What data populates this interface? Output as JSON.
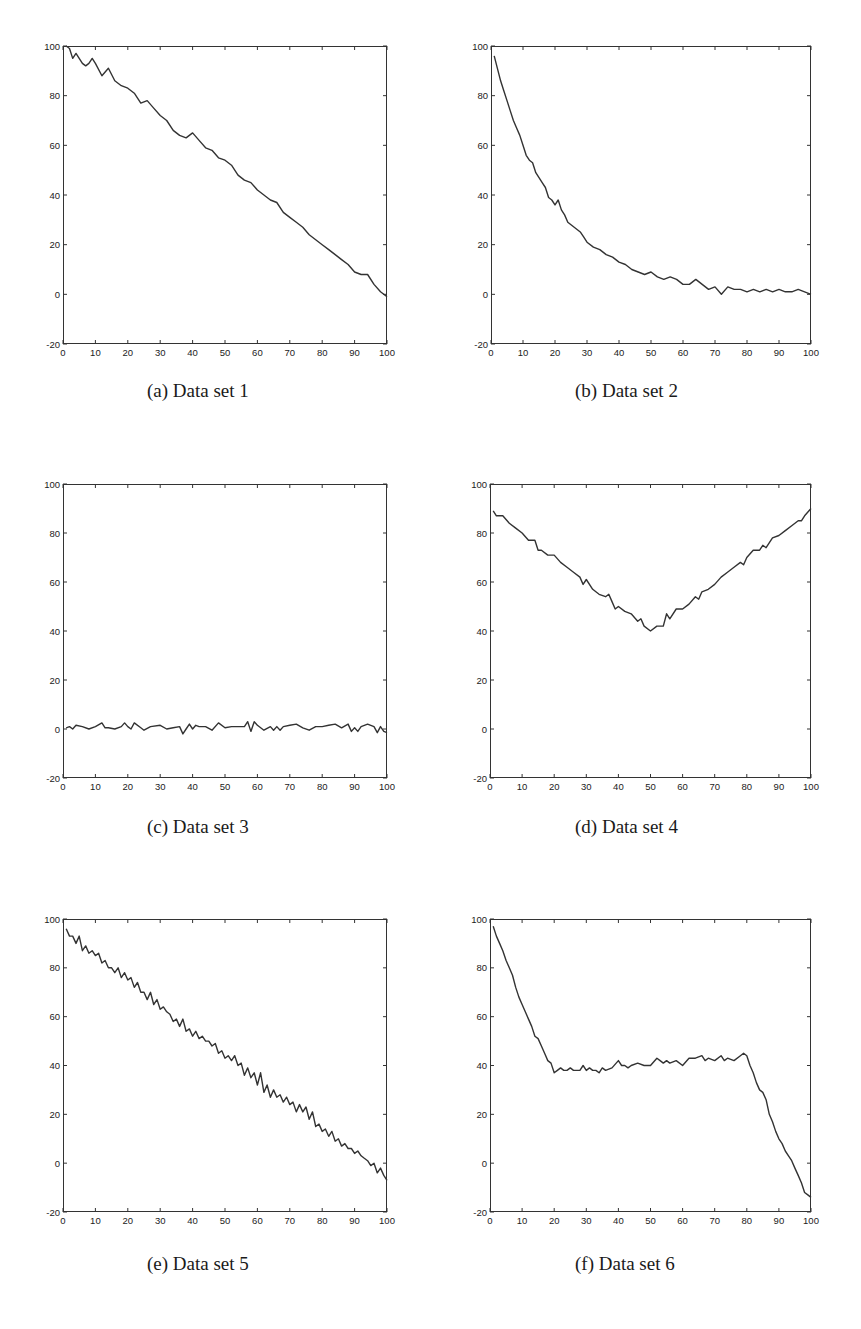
{
  "figure": {
    "panels": [
      {
        "id": "a",
        "caption": "(a) Data set 1"
      },
      {
        "id": "b",
        "caption": "(b) Data set 2"
      },
      {
        "id": "c",
        "caption": "(c) Data set 3"
      },
      {
        "id": "d",
        "caption": "(d) Data set 4"
      },
      {
        "id": "e",
        "caption": "(e) Data set 5"
      },
      {
        "id": "f",
        "caption": "(f) Data set 6"
      }
    ],
    "line_color": "#333333",
    "axis_color": "#333333"
  },
  "chart_data": [
    {
      "type": "line",
      "title": "(a) Data set 1",
      "xlabel": "",
      "ylabel": "",
      "xlim": [
        0,
        100
      ],
      "ylim": [
        -20,
        100
      ],
      "xticks": [
        0,
        10,
        20,
        30,
        40,
        50,
        60,
        70,
        80,
        90,
        100
      ],
      "yticks": [
        -20,
        0,
        20,
        40,
        60,
        80,
        100
      ],
      "grid": false,
      "x": [
        1,
        2,
        3,
        4,
        5,
        6,
        7,
        8,
        9,
        10,
        12,
        14,
        16,
        18,
        20,
        22,
        24,
        26,
        28,
        30,
        32,
        34,
        36,
        38,
        40,
        42,
        44,
        46,
        48,
        50,
        52,
        54,
        56,
        58,
        60,
        62,
        64,
        66,
        68,
        70,
        72,
        74,
        76,
        78,
        80,
        82,
        84,
        86,
        88,
        90,
        92,
        94,
        96,
        98,
        100
      ],
      "values": [
        100,
        99,
        95,
        97,
        95,
        93,
        92,
        93,
        95,
        93,
        88,
        91,
        86,
        84,
        83,
        81,
        77,
        78,
        75,
        72,
        70,
        66,
        64,
        63,
        65,
        62,
        59,
        58,
        55,
        54,
        52,
        48,
        46,
        45,
        42,
        40,
        38,
        37,
        33,
        31,
        29,
        27,
        24,
        22,
        20,
        18,
        16,
        14,
        12,
        9,
        8,
        8,
        4,
        1,
        -1
      ]
    },
    {
      "type": "line",
      "title": "(b) Data set 2",
      "xlabel": "",
      "ylabel": "",
      "xlim": [
        0,
        100
      ],
      "ylim": [
        -20,
        100
      ],
      "xticks": [
        0,
        10,
        20,
        30,
        40,
        50,
        60,
        70,
        80,
        90,
        100
      ],
      "yticks": [
        -20,
        0,
        20,
        40,
        60,
        80,
        100
      ],
      "grid": false,
      "x": [
        1,
        2,
        3,
        4,
        5,
        6,
        7,
        8,
        9,
        10,
        11,
        12,
        13,
        14,
        15,
        16,
        17,
        18,
        19,
        20,
        21,
        22,
        23,
        24,
        25,
        26,
        27,
        28,
        29,
        30,
        32,
        34,
        36,
        38,
        40,
        42,
        44,
        46,
        48,
        50,
        52,
        54,
        56,
        58,
        60,
        62,
        64,
        66,
        68,
        70,
        72,
        74,
        76,
        78,
        80,
        82,
        84,
        86,
        88,
        90,
        92,
        94,
        96,
        98,
        100
      ],
      "values": [
        96,
        91,
        86,
        82,
        78,
        74,
        70,
        67,
        64,
        60,
        56,
        54,
        53,
        49,
        47,
        45,
        43,
        39,
        38,
        36,
        38,
        34,
        32,
        29,
        28,
        27,
        26,
        25,
        23,
        21,
        19,
        18,
        16,
        15,
        13,
        12,
        10,
        9,
        8,
        9,
        7,
        6,
        7,
        6,
        4,
        4,
        6,
        4,
        2,
        3,
        0,
        3,
        2,
        2,
        1,
        2,
        1,
        2,
        1,
        2,
        1,
        1,
        2,
        1,
        0
      ]
    },
    {
      "type": "line",
      "title": "(c) Data set 3",
      "xlabel": "",
      "ylabel": "",
      "xlim": [
        0,
        100
      ],
      "ylim": [
        -20,
        100
      ],
      "xticks": [
        0,
        10,
        20,
        30,
        40,
        50,
        60,
        70,
        80,
        90,
        100
      ],
      "yticks": [
        -20,
        0,
        20,
        40,
        60,
        80,
        100
      ],
      "grid": false,
      "x": [
        1,
        2,
        3,
        4,
        6,
        8,
        10,
        12,
        13,
        14,
        16,
        18,
        19,
        20,
        21,
        22,
        24,
        25,
        27,
        30,
        32,
        34,
        36,
        37,
        38,
        39,
        40,
        41,
        42,
        44,
        46,
        48,
        50,
        52,
        54,
        56,
        57,
        58,
        59,
        60,
        62,
        64,
        65,
        66,
        67,
        68,
        70,
        72,
        74,
        76,
        78,
        80,
        82,
        84,
        86,
        88,
        89,
        90,
        91,
        92,
        94,
        96,
        97,
        98,
        99,
        100
      ],
      "values": [
        0.5,
        1,
        0,
        1.5,
        1,
        0,
        1,
        2.5,
        0.5,
        0.5,
        0,
        1,
        2.5,
        1,
        0,
        2.5,
        0.5,
        -0.5,
        1,
        1.5,
        0,
        0.5,
        1,
        -2,
        0,
        2,
        0,
        1.5,
        1,
        1,
        -0.5,
        2.5,
        0.5,
        1,
        1,
        1,
        3,
        -1,
        3,
        1.5,
        -0.5,
        1,
        -0.5,
        1,
        -0.5,
        1,
        1.5,
        2,
        0.5,
        -0.5,
        1,
        1,
        1.5,
        2,
        0.5,
        2,
        -1,
        0.5,
        -1,
        1,
        2,
        1,
        -1.5,
        1,
        -1,
        -1.5
      ]
    },
    {
      "type": "line",
      "title": "(d) Data set 4",
      "xlabel": "",
      "ylabel": "",
      "xlim": [
        0,
        100
      ],
      "ylim": [
        -20,
        100
      ],
      "xticks": [
        0,
        10,
        20,
        30,
        40,
        50,
        60,
        70,
        80,
        90,
        100
      ],
      "yticks": [
        -20,
        0,
        20,
        40,
        60,
        80,
        100
      ],
      "grid": false,
      "x": [
        1,
        2,
        4,
        6,
        8,
        10,
        12,
        14,
        15,
        16,
        18,
        20,
        22,
        24,
        26,
        28,
        29,
        30,
        32,
        34,
        36,
        37,
        38,
        39,
        40,
        42,
        44,
        46,
        47,
        48,
        50,
        52,
        54,
        55,
        56,
        58,
        60,
        62,
        64,
        65,
        66,
        68,
        70,
        72,
        74,
        76,
        78,
        79,
        80,
        82,
        84,
        85,
        86,
        88,
        90,
        92,
        94,
        96,
        97,
        98,
        100
      ],
      "values": [
        89,
        87,
        87,
        84,
        82,
        80,
        77,
        77,
        73,
        73,
        71,
        71,
        68,
        66,
        64,
        62,
        59,
        61,
        57,
        55,
        54,
        55,
        52,
        49,
        50,
        48,
        47,
        44,
        45,
        42,
        40,
        42,
        42,
        47,
        45,
        49,
        49,
        51,
        54,
        53,
        56,
        57,
        59,
        62,
        64,
        66,
        68,
        67,
        70,
        73,
        73,
        75,
        74,
        78,
        79,
        81,
        83,
        85,
        85,
        87,
        90
      ]
    },
    {
      "type": "line",
      "title": "(e) Data set 5",
      "xlabel": "",
      "ylabel": "",
      "xlim": [
        0,
        100
      ],
      "ylim": [
        -20,
        100
      ],
      "xticks": [
        0,
        10,
        20,
        30,
        40,
        50,
        60,
        70,
        80,
        90,
        100
      ],
      "yticks": [
        -20,
        0,
        20,
        40,
        60,
        80,
        100
      ],
      "grid": false,
      "x": [
        1,
        2,
        3,
        4,
        5,
        6,
        7,
        8,
        9,
        10,
        11,
        12,
        13,
        14,
        15,
        16,
        17,
        18,
        19,
        20,
        21,
        22,
        23,
        24,
        25,
        26,
        27,
        28,
        29,
        30,
        31,
        32,
        33,
        34,
        35,
        36,
        37,
        38,
        39,
        40,
        41,
        42,
        43,
        44,
        45,
        46,
        47,
        48,
        49,
        50,
        51,
        52,
        53,
        54,
        55,
        56,
        57,
        58,
        59,
        60,
        61,
        62,
        63,
        64,
        65,
        66,
        67,
        68,
        69,
        70,
        71,
        72,
        73,
        74,
        75,
        76,
        77,
        78,
        79,
        80,
        81,
        82,
        83,
        84,
        85,
        86,
        87,
        88,
        89,
        90,
        91,
        92,
        93,
        94,
        95,
        96,
        97,
        98,
        99,
        100
      ],
      "values": [
        96,
        93,
        93,
        90,
        93,
        87,
        89,
        86,
        87,
        85,
        86,
        82,
        83,
        80,
        80,
        78,
        80,
        76,
        78,
        75,
        76,
        72,
        74,
        70,
        70,
        67,
        70,
        65,
        67,
        63,
        64,
        62,
        61,
        58,
        59,
        56,
        59,
        54,
        55,
        52,
        54,
        51,
        52,
        50,
        50,
        48,
        49,
        45,
        46,
        43,
        44,
        42,
        44,
        40,
        41,
        36,
        39,
        35,
        37,
        32,
        37,
        29,
        32,
        27,
        30,
        27,
        28,
        25,
        27,
        24,
        25,
        21,
        24,
        21,
        23,
        18,
        21,
        15,
        16,
        13,
        14,
        11,
        13,
        9,
        10,
        7,
        8,
        6,
        6,
        4,
        5,
        3,
        2,
        1,
        -1,
        0,
        -4,
        -2,
        -5,
        -7
      ]
    },
    {
      "type": "line",
      "title": "(f) Data set 6",
      "xlabel": "",
      "ylabel": "",
      "xlim": [
        0,
        100
      ],
      "ylim": [
        -20,
        100
      ],
      "xticks": [
        0,
        10,
        20,
        30,
        40,
        50,
        60,
        70,
        80,
        90,
        100
      ],
      "yticks": [
        -20,
        0,
        20,
        40,
        60,
        80,
        100
      ],
      "grid": false,
      "x": [
        1,
        2,
        3,
        4,
        5,
        6,
        7,
        8,
        9,
        10,
        11,
        12,
        13,
        14,
        15,
        16,
        17,
        18,
        19,
        20,
        21,
        22,
        23,
        24,
        25,
        26,
        28,
        29,
        30,
        31,
        32,
        33,
        34,
        35,
        36,
        38,
        40,
        41,
        42,
        43,
        44,
        46,
        48,
        50,
        52,
        53,
        54,
        55,
        56,
        58,
        60,
        62,
        64,
        66,
        67,
        68,
        70,
        72,
        73,
        74,
        76,
        78,
        79,
        80,
        81,
        82,
        83,
        84,
        85,
        86,
        87,
        88,
        89,
        90,
        91,
        92,
        93,
        94,
        95,
        96,
        97,
        98,
        99,
        100
      ],
      "values": [
        97,
        93,
        90,
        87,
        83,
        80,
        77,
        72,
        68,
        65,
        62,
        59,
        56,
        52,
        51,
        48,
        45,
        42,
        41,
        37,
        38,
        39,
        38,
        38,
        39,
        38,
        38,
        40,
        38,
        39,
        38,
        38,
        37,
        39,
        38,
        39,
        42,
        40,
        40,
        39,
        40,
        41,
        40,
        40,
        43,
        42,
        41,
        42,
        41,
        42,
        40,
        43,
        43,
        44,
        42,
        43,
        42,
        44,
        42,
        43,
        42,
        44,
        45,
        44,
        40,
        37,
        33,
        30,
        29,
        26,
        20,
        17,
        13,
        10,
        8,
        5,
        3,
        1,
        -2,
        -5,
        -8,
        -12,
        -13,
        -14
      ]
    }
  ]
}
